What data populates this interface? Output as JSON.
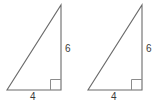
{
  "figure": {
    "background_color": "#ffffff",
    "stroke_color": "#6b6b6b",
    "right_angle_color": "#8c8c8c",
    "label_color": "#3a3a3a",
    "shapes": [
      {
        "name": "left-triangle",
        "type": "right-triangle",
        "vertices": {
          "bottom_left": [
            7,
            90
          ],
          "bottom_right": [
            61,
            90
          ],
          "apex": [
            61,
            5
          ]
        },
        "right_angle_vertex": "bottom_right",
        "labels": {
          "base": "4",
          "height": "6"
        }
      },
      {
        "name": "right-triangle",
        "type": "right-triangle",
        "vertices": {
          "bottom_left": [
            88,
            90
          ],
          "bottom_right": [
            142,
            90
          ],
          "apex": [
            142,
            5
          ]
        },
        "right_angle_vertex": "bottom_right",
        "labels": {
          "base": "4",
          "height": "6"
        }
      }
    ],
    "labels": {
      "left_base": "4",
      "left_height": "6",
      "right_base": "4",
      "right_height": "6"
    }
  }
}
